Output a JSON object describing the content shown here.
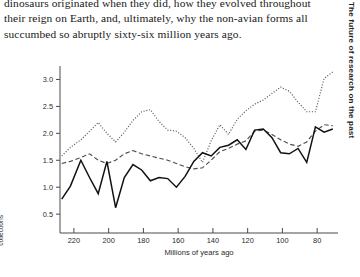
{
  "page": {
    "running_head": "The future of research on the past",
    "body_paragraph": "dinosaurs originated when they did, how they evolved throughout their reign on Earth, and, ultimately, why the non-avian forms all succumbed so abruptly sixty-six million years ago."
  },
  "figure": {
    "caption": "Three curves comparing: dinosaur taxic diversity, dinosaur-bearing rock formations, and dinosaur numbers in museum collections"
  },
  "chart_data": {
    "type": "line",
    "title": "",
    "xlabel": "Millions of years ago",
    "ylabel": "",
    "xlim": [
      228,
      68
    ],
    "ylim": [
      0.15,
      3.25
    ],
    "x_ticks": [
      220,
      200,
      180,
      160,
      140,
      120,
      100,
      80
    ],
    "y_ticks": [
      0.5,
      1.0,
      1.5,
      2.0,
      2.5,
      3.0
    ],
    "x_axis_inverted": true,
    "grid": false,
    "legend": "none",
    "series": [
      {
        "name": "dinosaur-bearing rock formations",
        "style": "dotted",
        "color": "#5a5a5a",
        "x": [
          227,
          222,
          216,
          211,
          206,
          201,
          196,
          191,
          186,
          181,
          176,
          171,
          166,
          161,
          156,
          151,
          146,
          141,
          136,
          131,
          126,
          121,
          116,
          111,
          106,
          101,
          96,
          91,
          86,
          81,
          76,
          71
        ],
        "y": [
          1.58,
          1.74,
          1.88,
          2.04,
          2.2,
          2.0,
          1.84,
          2.02,
          2.24,
          2.4,
          2.44,
          2.22,
          2.06,
          2.04,
          1.92,
          1.72,
          1.46,
          1.86,
          2.16,
          1.98,
          2.26,
          2.42,
          2.54,
          2.62,
          2.74,
          2.86,
          2.78,
          2.58,
          2.4,
          2.4,
          3.02,
          3.14
        ]
      },
      {
        "name": "dinosaur taxic diversity",
        "style": "dashed",
        "color": "#4d4d4d",
        "x": [
          227,
          222,
          216,
          211,
          206,
          201,
          196,
          191,
          186,
          181,
          176,
          171,
          166,
          161,
          156,
          151,
          146,
          141,
          136,
          131,
          126,
          121,
          116,
          111,
          106,
          101,
          96,
          91,
          86,
          81,
          76,
          71
        ],
        "y": [
          1.44,
          1.48,
          1.55,
          1.62,
          1.5,
          1.44,
          1.5,
          1.62,
          1.68,
          1.62,
          1.58,
          1.54,
          1.5,
          1.44,
          1.38,
          1.34,
          1.36,
          1.5,
          1.66,
          1.72,
          1.8,
          1.86,
          2.04,
          2.06,
          1.98,
          1.88,
          1.8,
          1.76,
          1.84,
          2.04,
          2.16,
          2.14
        ]
      },
      {
        "name": "dinosaur numbers in museum collections",
        "style": "solid",
        "color": "#111111",
        "x": [
          227,
          222,
          216,
          211,
          206,
          201,
          196,
          191,
          186,
          181,
          176,
          171,
          166,
          161,
          156,
          151,
          146,
          141,
          136,
          131,
          126,
          121,
          116,
          111,
          106,
          101,
          96,
          91,
          86,
          81,
          76,
          71
        ],
        "y": [
          0.78,
          1.02,
          1.5,
          1.18,
          0.88,
          1.48,
          0.62,
          1.18,
          1.42,
          1.32,
          1.12,
          1.18,
          1.16,
          1.0,
          1.2,
          1.48,
          1.64,
          1.58,
          1.74,
          1.78,
          1.88,
          1.7,
          2.06,
          2.08,
          1.92,
          1.64,
          1.62,
          1.72,
          1.46,
          2.12,
          2.02,
          2.08
        ]
      }
    ]
  }
}
